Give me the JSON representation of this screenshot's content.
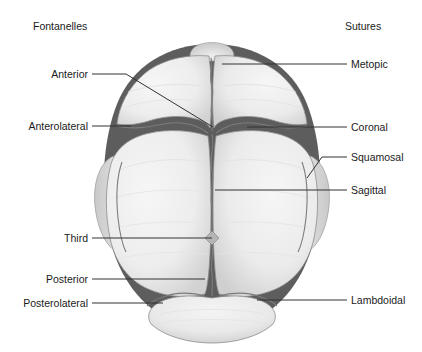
{
  "figure": {
    "title_left": "Fontanelles",
    "title_right": "Sutures",
    "view": "superior view of fetal skull",
    "colors": {
      "background": "#ffffff",
      "bone_fill": "#efefef",
      "bone_edge_shade": "#d4d4d4",
      "fontanelle_fill": "#5d5d5d",
      "suture_line": "#7a7a7a",
      "leader_line": "#333333",
      "text": "#1b1b1b"
    },
    "fontanelles": [
      {
        "id": "anterior",
        "label": "Anterior",
        "label_x": 88,
        "label_y": 74,
        "target_x": 213,
        "target_y": 127
      },
      {
        "id": "anterolateral",
        "label": "Anterolateral",
        "label_x": 88,
        "label_y": 126,
        "target_x": 131,
        "target_y": 126
      },
      {
        "id": "third",
        "label": "Third",
        "label_x": 88,
        "label_y": 238,
        "target_x": 212,
        "target_y": 238
      },
      {
        "id": "posterior",
        "label": "Posterior",
        "label_x": 88,
        "label_y": 279,
        "target_x": 205,
        "target_y": 279
      },
      {
        "id": "posterolateral",
        "label": "Posterolateral",
        "label_x": 88,
        "label_y": 303,
        "target_x": 163,
        "target_y": 303
      }
    ],
    "sutures": [
      {
        "id": "metopic",
        "label": "Metopic",
        "label_x": 351,
        "label_y": 64,
        "target_x": 222,
        "target_y": 64
      },
      {
        "id": "coronal",
        "label": "Coronal",
        "label_x": 351,
        "label_y": 127,
        "target_x": 247,
        "target_y": 127
      },
      {
        "id": "squamosal",
        "label": "Squamosal",
        "label_x": 351,
        "label_y": 157,
        "target_x": 307,
        "target_y": 178
      },
      {
        "id": "sagittal",
        "label": "Sagittal",
        "label_x": 351,
        "label_y": 190,
        "target_x": 215,
        "target_y": 190
      },
      {
        "id": "lambdoidal",
        "label": "Lambdoidal",
        "label_x": 351,
        "label_y": 300,
        "target_x": 257,
        "target_y": 300
      }
    ]
  }
}
